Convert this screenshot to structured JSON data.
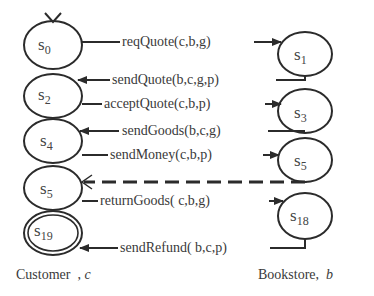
{
  "diagram": {
    "type": "interaction-protocol-state-machines",
    "colors": {
      "stroke": "#2b2b2b",
      "text": "#3a3a3a",
      "background": "#ffffff"
    },
    "customer": {
      "caption": "Customer",
      "var": "c",
      "states": [
        {
          "id": "s0",
          "base": "s",
          "sub": "0",
          "initial": true
        },
        {
          "id": "s2",
          "base": "s",
          "sub": "2"
        },
        {
          "id": "s4",
          "base": "s",
          "sub": "4"
        },
        {
          "id": "s5",
          "base": "s",
          "sub": "5"
        },
        {
          "id": "s19",
          "base": "s",
          "sub": "19",
          "final": true
        }
      ]
    },
    "bookstore": {
      "caption": "Bookstore,",
      "var": "b",
      "states": [
        {
          "id": "s1",
          "base": "s",
          "sub": "1"
        },
        {
          "id": "s3",
          "base": "s",
          "sub": "3"
        },
        {
          "id": "s5",
          "base": "s",
          "sub": "5"
        },
        {
          "id": "s18",
          "base": "s",
          "sub": "18"
        }
      ]
    },
    "messages": [
      {
        "label": "reqQuote(c,b,g)",
        "from": "customer.s0",
        "to": "bookstore.s1",
        "dir": "right"
      },
      {
        "label": "sendQuote(b,c,g,p)",
        "from": "bookstore.s1",
        "to": "customer.s2",
        "dir": "left"
      },
      {
        "label": "acceptQuote(c,b,p)",
        "from": "customer.s2",
        "to": "bookstore.s3",
        "dir": "right"
      },
      {
        "label": "sendGoods(b,c,g)",
        "from": "bookstore.s3",
        "to": "customer.s4",
        "dir": "left"
      },
      {
        "label": "sendMoney(c,b,p)",
        "from": "customer.s4",
        "to": "bookstore.s5",
        "dir": "right"
      },
      {
        "label": "",
        "from": "bookstore.s5",
        "to": "customer.s5",
        "dir": "left",
        "style": "dashed"
      },
      {
        "label": "returnGoods( c,b,g)",
        "from": "customer.s5",
        "to": "bookstore.s18",
        "dir": "right"
      },
      {
        "label": "sendRefund( b,c,p)",
        "from": "bookstore.s18",
        "to": "customer.s19",
        "dir": "left"
      }
    ]
  }
}
